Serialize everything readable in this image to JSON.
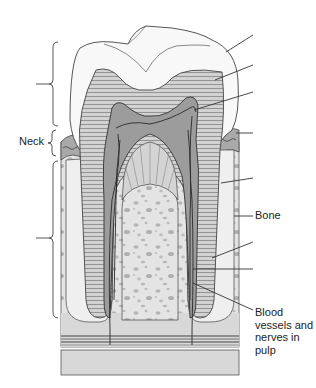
{
  "diagram": {
    "labels": {
      "neck": "Neck",
      "bone": "Bone",
      "blood_vessels": "Blood vessels and nerves in pulp"
    },
    "unlabeled_leaders": [
      {
        "points_to": "enamel",
        "y": 35
      },
      {
        "points_to": "dentin",
        "y": 65
      },
      {
        "points_to": "pulp cavity",
        "y": 92
      },
      {
        "points_to": "gingiva (gum)",
        "y": 133
      },
      {
        "points_to": "periodontal ligament / cementum",
        "y": 178
      },
      {
        "points_to": "root canal wall",
        "y": 242
      },
      {
        "points_to": "root canal",
        "y": 269
      }
    ],
    "brackets": [
      {
        "region": "crown",
        "y_range": [
          41,
          126
        ]
      },
      {
        "region": "neck",
        "y_range": [
          128,
          158
        ]
      },
      {
        "region": "root",
        "y_range": [
          160,
          318
        ]
      }
    ],
    "colors": {
      "line": "#3a3a3a",
      "enamel": "#f7f7f7",
      "dentin": "#cfcfcf",
      "pulp": "#9a9a9a",
      "gum": "#a8a8a8",
      "bone": "#e3e3e3",
      "bone_spots": "#b8b8b8",
      "ligament": "#ececec"
    }
  }
}
